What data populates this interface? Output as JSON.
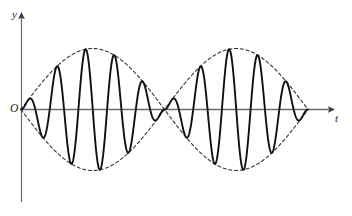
{
  "figure": {
    "background_color": "#ffffff"
  },
  "axes": {
    "y_label": "y",
    "t_label": "t",
    "origin_label": "O",
    "axis_color": "#555555",
    "y_axis": {
      "x": 21,
      "y_top": 15,
      "y_bottom": 200
    },
    "t_axis": {
      "y": 109,
      "x_left": 21,
      "x_right": 335
    }
  },
  "chart_data": {
    "type": "line",
    "xlabel": "t",
    "ylabel": "y",
    "grid": false,
    "legend": null,
    "xlim": [
      21,
      310
    ],
    "ylim": [
      -1.05,
      1.05
    ],
    "annotations": [
      "O"
    ],
    "series": [
      {
        "name": "carrier-wave",
        "style": "solid",
        "color": "#000000",
        "line_width": 1.9,
        "description": "Carrier sine wave modulated by the envelope; two wave packets (beats) between envelope nodes.",
        "carrier_cycles_per_packet": 5,
        "x_start": 21,
        "x_end": 308,
        "formula": "y = |sin(pi*(x-21)/143)| * sin(2*pi*(x-21)/28.6)"
      },
      {
        "name": "envelope-upper",
        "style": "dashed",
        "color": "#2b2b2b",
        "line_width": 1.0,
        "description": "Upper dashed amplitude envelope |sin| with nodes at x = 21, 164.5, 308",
        "formula": "y = |sin(pi*(x-21)/143.5)|"
      },
      {
        "name": "envelope-lower",
        "style": "dashed",
        "color": "#2b2b2b",
        "line_width": 1.0,
        "description": "Lower dashed amplitude envelope, mirror of upper",
        "formula": "y = -|sin(pi*(x-21)/143.5)|"
      }
    ],
    "envelope_nodes_x": [
      21,
      164.5,
      308
    ],
    "envelope_peaks": [
      {
        "x": 92.75,
        "y": 1.0
      },
      {
        "x": 236.25,
        "y": 1.0
      }
    ],
    "packet_count": 2,
    "amplitude_px": 61
  }
}
